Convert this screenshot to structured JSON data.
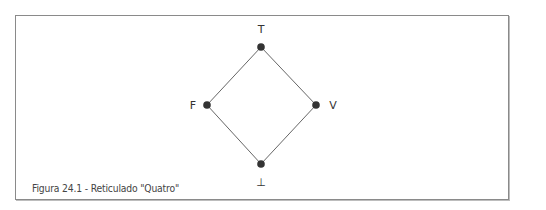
{
  "figure": {
    "caption": "Figura 24.1 - Reticulado \"Quatro\"",
    "colors": {
      "line": "#555555",
      "node": "#333333",
      "frame": "#8a8a8a",
      "text": "#444444"
    }
  },
  "lattice": {
    "nodes": [
      {
        "id": "top",
        "label": "T"
      },
      {
        "id": "F",
        "label": "F"
      },
      {
        "id": "V",
        "label": "V"
      },
      {
        "id": "bottom",
        "label": "⊥"
      }
    ],
    "edges": [
      {
        "from": "top",
        "to": "F"
      },
      {
        "from": "top",
        "to": "V"
      },
      {
        "from": "F",
        "to": "bottom"
      },
      {
        "from": "V",
        "to": "bottom"
      }
    ]
  }
}
